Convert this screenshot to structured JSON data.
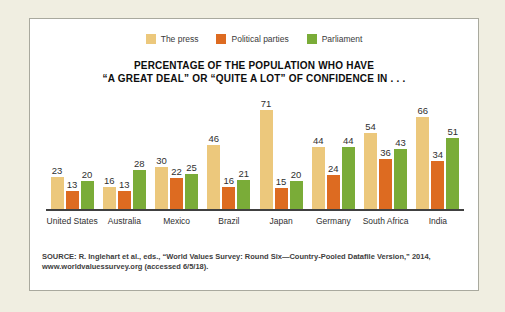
{
  "page": {
    "background_color": "#f0eee1"
  },
  "panel": {
    "background_color": "#ffffff",
    "border_color": "#a9a99e"
  },
  "legend": {
    "items": [
      {
        "label": "The press",
        "color": "#ecc87c"
      },
      {
        "label": "Political parties",
        "color": "#dd6b21"
      },
      {
        "label": "Parliament",
        "color": "#7aac38"
      }
    ]
  },
  "title": {
    "line1": "PERCENTAGE OF THE POPULATION WHO HAVE",
    "line2": "“A GREAT DEAL” OR “QUITE A LOT” OF CONFIDENCE IN . . ."
  },
  "source": {
    "line1": "SOURCE: R. Inglehart et al., eds., “World Values Survey: Round Six—Country-Pooled Datafile Version,” 2014,",
    "line2": "www.worldvaluessurvey.org (accessed 6/5/18)."
  },
  "chart_data": {
    "type": "bar",
    "title": "PERCENTAGE OF THE POPULATION WHO HAVE “A GREAT DEAL” OR “QUITE A LOT” OF CONFIDENCE IN . . .",
    "categories": [
      "United States",
      "Australia",
      "Mexico",
      "Brazil",
      "Japan",
      "Germany",
      "South Africa",
      "India"
    ],
    "series": [
      {
        "name": "The press",
        "color": "#ecc87c",
        "values": [
          23,
          16,
          30,
          46,
          71,
          44,
          54,
          66
        ]
      },
      {
        "name": "Political parties",
        "color": "#dd6b21",
        "values": [
          13,
          13,
          22,
          16,
          15,
          24,
          36,
          34
        ]
      },
      {
        "name": "Parliament",
        "color": "#7aac38",
        "values": [
          20,
          28,
          25,
          21,
          20,
          44,
          43,
          51
        ]
      }
    ],
    "xlabel": "",
    "ylabel": "",
    "ylim": [
      0,
      80
    ],
    "grid": false,
    "value_labels": true,
    "legend_position": "top",
    "px_per_unit": 1.4
  }
}
